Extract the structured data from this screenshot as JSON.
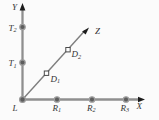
{
  "figure": {
    "axis_labels": {
      "x": "X",
      "y": "Y",
      "z": "Z"
    },
    "origin": {
      "base": "L",
      "sub": ""
    },
    "points": {
      "t2": {
        "base": "T",
        "sub": "2"
      },
      "t1": {
        "base": "T",
        "sub": "1"
      },
      "d2": {
        "base": "D",
        "sub": "2"
      },
      "d1": {
        "base": "D",
        "sub": "1"
      },
      "r1": {
        "base": "R",
        "sub": "1"
      },
      "r2": {
        "base": "R",
        "sub": "2"
      },
      "r3": {
        "base": "R",
        "sub": "3"
      }
    },
    "colors": {
      "background": "#fbfbfb",
      "axis_line": "#8f8f8f",
      "diagonal_line": "#7e7e7e",
      "arrowhead": "#1c1c1c",
      "marker_fill": "#5d5d5d",
      "marker_ring": "#9d9d9d",
      "square_stroke": "#4a4a4a",
      "label_text": "#333333"
    }
  }
}
